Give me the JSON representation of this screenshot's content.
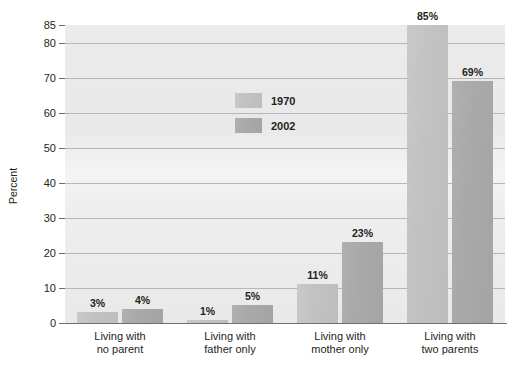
{
  "chart_data": {
    "type": "bar",
    "title": "",
    "xlabel": "",
    "ylabel": "Percent",
    "ylim": [
      0,
      85
    ],
    "yticks": [
      0,
      10,
      20,
      30,
      40,
      50,
      60,
      70,
      80,
      85
    ],
    "grid": true,
    "legend_position": "inside-upper-left",
    "categories": [
      "Living with\nno parent",
      "Living with\nfather only",
      "Living with\nmother only",
      "Living with\ntwo parents"
    ],
    "category_lines": [
      [
        "Living with",
        "no parent"
      ],
      [
        "Living with",
        "father only"
      ],
      [
        "Living with",
        "mother only"
      ],
      [
        "Living with",
        "two parents"
      ]
    ],
    "series": [
      {
        "name": "1970",
        "color": "#c2c2c2",
        "values": [
          3,
          1,
          11,
          85
        ],
        "labels": [
          "3%",
          "1%",
          "11%",
          "85%"
        ]
      },
      {
        "name": "2002",
        "color": "#a9a9a9",
        "values": [
          4,
          5,
          23,
          69
        ],
        "labels": [
          "4%",
          "5%",
          "23%",
          "69%"
        ]
      }
    ]
  },
  "axis": {
    "y_title": "Percent",
    "y_tick_labels": [
      "85",
      "80",
      "70",
      "60",
      "50",
      "40",
      "30",
      "20",
      "10",
      "0"
    ]
  },
  "legend": {
    "entries": [
      {
        "label": "1970",
        "swatch": "legend-swatch-1970"
      },
      {
        "label": "2002",
        "swatch": "legend-swatch-2002"
      }
    ]
  },
  "colors": {
    "series_1970": "#c2c2c2",
    "series_2002": "#a9a9a9",
    "plot_background": "#ebebeb",
    "gridline": "#b6b6b6",
    "axis": "#6f6f6f",
    "text": "#231f20",
    "page_background": "#ffffff"
  }
}
